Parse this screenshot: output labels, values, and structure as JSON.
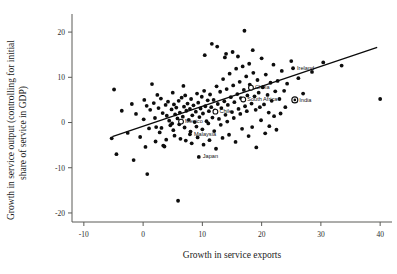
{
  "chart_data": {
    "type": "scatter",
    "title": "",
    "subtitle": "",
    "xlabel": "Growth in service exports",
    "ylabel": "Growth in service output (controlling for initial share of service in GDP)",
    "ylabel_line1": "Growth in service output (controlling for initial",
    "ylabel_line2": "share of service in GDP)",
    "xlim": [
      -12,
      42
    ],
    "ylim": [
      -22,
      24
    ],
    "xticks": [
      -10,
      0,
      10,
      20,
      30,
      40
    ],
    "xtick_labels": [
      "-10",
      "0",
      "10",
      "20",
      "30",
      "40"
    ],
    "yticks": [
      -20,
      -10,
      0,
      10,
      20
    ],
    "ytick_labels": [
      "-20",
      "-10",
      "0",
      "10",
      "20"
    ],
    "grid": false,
    "legend": "none",
    "marker_color": "#0d0d0d",
    "line_color": "#0a0a0a",
    "axis_color": "#5a5a56",
    "fit_line": {
      "label": "regression line",
      "x_start": -5.2,
      "y_start": -3.1,
      "x_end": 39.5,
      "y_end": 16.6
    },
    "annotations": [
      {
        "name": "Ireland",
        "x": 25.3,
        "y": 12.0,
        "marker": "filled",
        "label_dx": 4,
        "label_dy": 1.6
      },
      {
        "name": "China",
        "x": 18.2,
        "y": 7.7,
        "marker": "hollow",
        "label_dx": 4,
        "label_dy": 1.6
      },
      {
        "name": "South Africa",
        "x": 16.9,
        "y": 5.1,
        "marker": "hollow",
        "label_dx": 4,
        "label_dy": 1.6
      },
      {
        "name": "India",
        "x": 25.6,
        "y": 5.0,
        "marker": "target",
        "label_dx": 4.5,
        "label_dy": 1.6
      },
      {
        "name": "Chile",
        "x": 12.2,
        "y": 2.4,
        "marker": "hollow",
        "label_dx": 4,
        "label_dy": 1.6
      },
      {
        "name": "Mexico",
        "x": 6.4,
        "y": 0.2,
        "marker": "hollow",
        "label_dx": 4,
        "label_dy": 1.6
      },
      {
        "name": "Malaysia",
        "x": 7.9,
        "y": -2.6,
        "marker": "filled",
        "label_dx": 4,
        "label_dy": 1.6
      },
      {
        "name": "Japan",
        "x": 9.4,
        "y": -7.6,
        "marker": "filled",
        "label_dx": 4,
        "label_dy": 1.6
      }
    ],
    "points": [
      [
        -4.9,
        7.3
      ],
      [
        -4.5,
        -7.0
      ],
      [
        -3.6,
        2.6
      ],
      [
        -5.3,
        -3.5
      ],
      [
        -2.6,
        -2.3
      ],
      [
        -1.9,
        4.1
      ],
      [
        -1.2,
        1.9
      ],
      [
        -1.6,
        -8.3
      ],
      [
        -0.5,
        -3.2
      ],
      [
        0.2,
        5.0
      ],
      [
        0.6,
        3.7
      ],
      [
        0.4,
        -5.4
      ],
      [
        0.7,
        -11.4
      ],
      [
        1.5,
        8.5
      ],
      [
        1.2,
        2.8
      ],
      [
        1.8,
        4.3
      ],
      [
        2.0,
        1.0
      ],
      [
        2.4,
        6.1
      ],
      [
        2.6,
        3.2
      ],
      [
        2.2,
        -1.0
      ],
      [
        2.8,
        -2.2
      ],
      [
        3.0,
        5.3
      ],
      [
        3.3,
        2.1
      ],
      [
        3.1,
        -1.2
      ],
      [
        3.4,
        -5.1
      ],
      [
        3.6,
        -5.3
      ],
      [
        3.8,
        3.9
      ],
      [
        4.0,
        1.5
      ],
      [
        4.2,
        4.6
      ],
      [
        4.4,
        0.4
      ],
      [
        4.6,
        -0.6
      ],
      [
        4.8,
        2.9
      ],
      [
        5.0,
        6.6
      ],
      [
        5.2,
        4.0
      ],
      [
        5.4,
        1.8
      ],
      [
        5.6,
        3.3
      ],
      [
        5.1,
        -1.7
      ],
      [
        5.8,
        0.9
      ],
      [
        5.3,
        -2.9
      ],
      [
        6.0,
        4.8
      ],
      [
        6.2,
        2.2
      ],
      [
        6.5,
        5.5
      ],
      [
        6.1,
        -0.4
      ],
      [
        6.7,
        1.3
      ],
      [
        6.3,
        -3.6
      ],
      [
        6.9,
        3.5
      ],
      [
        5.9,
        -17.3
      ],
      [
        7.1,
        6.0
      ],
      [
        7.3,
        2.6
      ],
      [
        7.0,
        -1.1
      ],
      [
        7.5,
        4.2
      ],
      [
        7.7,
        0.6
      ],
      [
        7.2,
        -4.0
      ],
      [
        7.9,
        3.0
      ],
      [
        8.1,
        5.2
      ],
      [
        8.3,
        1.6
      ],
      [
        8.0,
        -2.0
      ],
      [
        8.5,
        3.8
      ],
      [
        8.7,
        0.1
      ],
      [
        8.2,
        -4.6
      ],
      [
        8.9,
        2.4
      ],
      [
        9.1,
        6.4
      ],
      [
        9.3,
        4.4
      ],
      [
        9.0,
        -0.9
      ],
      [
        9.5,
        1.2
      ],
      [
        9.7,
        3.1
      ],
      [
        9.2,
        -3.3
      ],
      [
        9.9,
        5.7
      ],
      [
        10.1,
        2.0
      ],
      [
        10.3,
        7.0
      ],
      [
        10.0,
        -1.5
      ],
      [
        10.5,
        3.6
      ],
      [
        10.7,
        0.3
      ],
      [
        10.2,
        -4.9
      ],
      [
        10.9,
        4.9
      ],
      [
        11.1,
        2.5
      ],
      [
        11.3,
        6.2
      ],
      [
        11.0,
        -0.2
      ],
      [
        11.5,
        3.4
      ],
      [
        11.7,
        1.1
      ],
      [
        11.2,
        -3.9
      ],
      [
        11.9,
        5.0
      ],
      [
        12.1,
        2.7
      ],
      [
        12.4,
        8.0
      ],
      [
        12.0,
        -1.9
      ],
      [
        12.6,
        4.1
      ],
      [
        12.8,
        0.8
      ],
      [
        12.3,
        -5.8
      ],
      [
        13.0,
        6.8
      ],
      [
        13.2,
        3.2
      ],
      [
        13.5,
        9.6
      ],
      [
        13.1,
        -0.5
      ],
      [
        13.7,
        4.7
      ],
      [
        13.9,
        1.7
      ],
      [
        13.4,
        -3.4
      ],
      [
        14.1,
        7.4
      ],
      [
        14.3,
        3.9
      ],
      [
        14.6,
        10.8
      ],
      [
        14.2,
        0.2
      ],
      [
        14.8,
        5.6
      ],
      [
        15.0,
        2.3
      ],
      [
        14.5,
        -2.7
      ],
      [
        15.2,
        8.2
      ],
      [
        15.4,
        4.5
      ],
      [
        15.7,
        11.9
      ],
      [
        15.3,
        1.0
      ],
      [
        15.9,
        6.3
      ],
      [
        16.1,
        3.0
      ],
      [
        15.6,
        -4.3
      ],
      [
        16.3,
        9.0
      ],
      [
        16.5,
        5.4
      ],
      [
        16.8,
        12.4
      ],
      [
        16.4,
        1.9
      ],
      [
        17.0,
        7.2
      ],
      [
        17.2,
        3.6
      ],
      [
        16.7,
        -1.4
      ],
      [
        17.4,
        10.2
      ],
      [
        17.6,
        6.0
      ],
      [
        17.9,
        13.0
      ],
      [
        17.5,
        2.5
      ],
      [
        18.0,
        8.4
      ],
      [
        18.3,
        4.2
      ],
      [
        17.8,
        -3.0
      ],
      [
        18.6,
        11.0
      ],
      [
        18.8,
        5.8
      ],
      [
        19.0,
        2.8
      ],
      [
        18.4,
        -1.0
      ],
      [
        19.3,
        9.4
      ],
      [
        19.5,
        6.6
      ],
      [
        19.7,
        3.4
      ],
      [
        19.1,
        -5.5
      ],
      [
        20.0,
        14.2
      ],
      [
        20.2,
        7.8
      ],
      [
        20.4,
        4.0
      ],
      [
        19.9,
        0.5
      ],
      [
        20.7,
        10.6
      ],
      [
        21.0,
        6.1
      ],
      [
        21.2,
        2.2
      ],
      [
        20.6,
        -2.4
      ],
      [
        21.5,
        8.8
      ],
      [
        21.7,
        4.8
      ],
      [
        21.3,
        -0.8
      ],
      [
        22.0,
        12.8
      ],
      [
        22.3,
        6.9
      ],
      [
        22.1,
        1.4
      ],
      [
        22.7,
        9.2
      ],
      [
        23.0,
        5.2
      ],
      [
        22.5,
        -1.6
      ],
      [
        23.4,
        11.4
      ],
      [
        23.8,
        7.0
      ],
      [
        23.2,
        2.0
      ],
      [
        24.3,
        8.6
      ],
      [
        24.0,
        3.4
      ],
      [
        25.0,
        13.6
      ],
      [
        26.2,
        9.8
      ],
      [
        27.0,
        6.4
      ],
      [
        28.5,
        11.2
      ],
      [
        30.4,
        13.3
      ],
      [
        33.5,
        12.6
      ],
      [
        40.0,
        5.2
      ],
      [
        12.5,
        16.8
      ],
      [
        10.4,
        14.9
      ],
      [
        14.0,
        15.2
      ],
      [
        15.1,
        15.6
      ],
      [
        13.8,
        14.4
      ],
      [
        16.0,
        14.6
      ],
      [
        17.1,
        20.3
      ],
      [
        11.6,
        17.4
      ],
      [
        18.5,
        16.0
      ],
      [
        6.8,
        8.1
      ],
      [
        4.9,
        -0.2
      ],
      [
        3.9,
        -3.8
      ],
      [
        2.1,
        -4.2
      ],
      [
        1.0,
        -1.3
      ],
      [
        0.1,
        0.7
      ]
    ]
  }
}
